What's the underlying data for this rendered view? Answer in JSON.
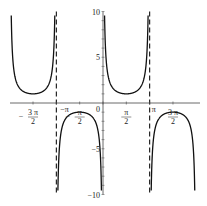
{
  "chart_data": {
    "type": "line",
    "title": "",
    "function": "csc(x)",
    "xlabel": "",
    "ylabel": "",
    "xlim": [
      -6.6,
      6.6
    ],
    "ylim": [
      -10,
      10
    ],
    "grid": false,
    "legend": null,
    "x_ticks": [
      {
        "value": -4.712,
        "label_num": "3 π",
        "label_den": "2",
        "sign": "−"
      },
      {
        "value": -3.1416,
        "label": "−π"
      },
      {
        "value": -1.5708,
        "label_num": "π",
        "label_den": "2",
        "sign": "−"
      },
      {
        "value": 0,
        "label": "0"
      },
      {
        "value": 1.5708,
        "label_num": "π",
        "label_den": "2",
        "sign": ""
      },
      {
        "value": 3.1416,
        "label": "π"
      },
      {
        "value": 4.712,
        "label_num": "3 π",
        "label_den": "2",
        "sign": ""
      }
    ],
    "y_ticks": [
      {
        "value": 10,
        "label": "10"
      },
      {
        "value": 5,
        "label": "5"
      },
      {
        "value": -5,
        "label": "−5"
      },
      {
        "value": -10,
        "label": "−10"
      }
    ],
    "asymptotes": [
      -3.1416,
      3.1416
    ],
    "series": [
      {
        "name": "branch (-2π,-π)",
        "domain": [
          -6.283,
          -3.1416
        ],
        "extremum": {
          "x": -4.712,
          "y": 1
        }
      },
      {
        "name": "branch (-π,0)",
        "domain": [
          -3.1416,
          0
        ],
        "extremum": {
          "x": -1.5708,
          "y": -1
        }
      },
      {
        "name": "branch (0,π)",
        "domain": [
          0,
          3.1416
        ],
        "extremum": {
          "x": 1.5708,
          "y": 1
        }
      },
      {
        "name": "branch (π,2π)",
        "domain": [
          3.1416,
          6.283
        ],
        "extremum": {
          "x": 4.712,
          "y": -1
        }
      }
    ]
  },
  "labels": {
    "top_fragment": "g(x) = csc(x) on [−2π, 2π]"
  }
}
